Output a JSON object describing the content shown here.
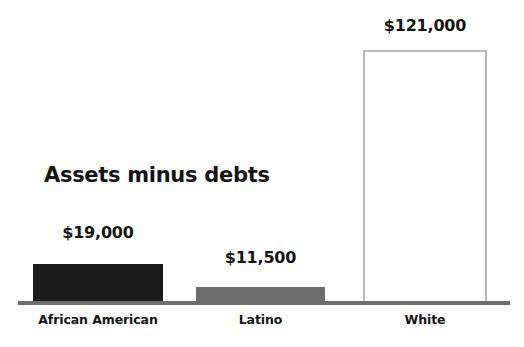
{
  "chart_data": {
    "type": "bar",
    "title": "Assets minus debts",
    "subtitle": "",
    "xlabel": "",
    "ylabel": "",
    "categories": [
      "African American",
      "Latino",
      "White"
    ],
    "values": [
      19000,
      11500,
      121000
    ],
    "value_labels": [
      "$19,000",
      "$11,500",
      "$121,000"
    ],
    "bar_colors": [
      "#1a1a1a",
      "#6e6e6e",
      "#ffffff"
    ],
    "bar_outline_colors": [
      "none",
      "none",
      "#b9b9b9"
    ],
    "ylim": [
      0,
      145000
    ],
    "grid": false,
    "legend": "none",
    "axis_line_color": "#6d6d6d",
    "background": "#ffffff",
    "text_color": "#141414"
  },
  "chart": {
    "title": "Assets minus debts",
    "bars": [
      {
        "category": "African American",
        "value_label": "$19,000"
      },
      {
        "category": "Latino",
        "value_label": "$11,500"
      },
      {
        "category": "White",
        "value_label": "$121,000"
      }
    ]
  }
}
